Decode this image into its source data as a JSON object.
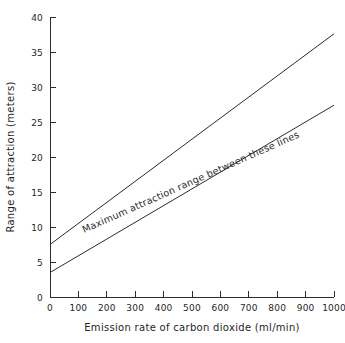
{
  "chart_data": {
    "type": "line",
    "title": "",
    "subtitle": "",
    "xlabel": "Emission rate of carbon dioxide (ml/min)",
    "ylabel": "Range of attraction (meters)",
    "xlim": [
      0,
      1000
    ],
    "ylim": [
      0,
      40
    ],
    "xticks": [
      0,
      100,
      200,
      300,
      400,
      500,
      600,
      700,
      800,
      900,
      1000
    ],
    "yticks": [
      0,
      5,
      10,
      15,
      20,
      25,
      30,
      35,
      40
    ],
    "xtick_labels": [
      "0",
      "100",
      "200",
      "300",
      "400",
      "500",
      "600",
      "700",
      "800",
      "900",
      "1000"
    ],
    "ytick_labels": [
      "0",
      "5",
      "10",
      "15",
      "20",
      "25",
      "30",
      "35",
      "40"
    ],
    "grid": false,
    "legend": false,
    "legend_position": "none",
    "x": [
      0,
      1000
    ],
    "series": [
      {
        "name": "upper bound",
        "values": [
          7.5,
          37.6
        ]
      },
      {
        "name": "lower bound",
        "values": [
          3.5,
          27.4
        ]
      }
    ],
    "annotations": [
      {
        "text": "Maximum attraction range between these lines",
        "x": 500,
        "y": 16.0,
        "rotation": -24
      }
    ],
    "colors": {
      "line": "#2b2b2b",
      "axis": "#2b2b2b",
      "text": "#1f1f1f",
      "background": "#ffffff"
    }
  }
}
